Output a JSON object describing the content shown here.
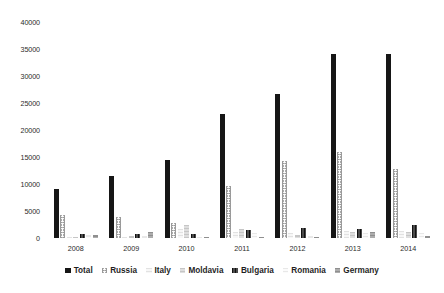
{
  "chart_data": {
    "type": "bar",
    "title": "",
    "subtitle": "",
    "xlabel": "",
    "ylabel": "",
    "categories": [
      "2008",
      "2009",
      "2010",
      "2011",
      "2012",
      "2013",
      "2014"
    ],
    "ylim": [
      0,
      40000
    ],
    "ytick_labels": [
      "40000",
      "35000",
      "30000",
      "25000",
      "20000",
      "15000",
      "10000",
      "5000",
      "0"
    ],
    "ytick_values": [
      40000,
      35000,
      30000,
      25000,
      20000,
      15000,
      10000,
      5000,
      0
    ],
    "grid": false,
    "legend_position": "bottom",
    "series": [
      {
        "name": "Total",
        "color": "#161616",
        "pattern": "solid",
        "values": [
          9000,
          11500,
          14500,
          23000,
          26700,
          34000,
          34000
        ]
      },
      {
        "name": "Russia",
        "color": "#9a9a9a",
        "pattern": "dotted-circles",
        "values": [
          4200,
          3900,
          2800,
          9700,
          14300,
          16000,
          12800
        ]
      },
      {
        "name": "Italy",
        "color": "#eeeeee",
        "pattern": "light-horizontal",
        "values": [
          200,
          200,
          1700,
          1200,
          900,
          1300,
          1300
        ]
      },
      {
        "name": "Moldavia",
        "color": "#d2d2d2",
        "pattern": "light-gray-horizontal",
        "values": [
          200,
          300,
          2500,
          1600,
          600,
          1200,
          1100
        ]
      },
      {
        "name": "Bulgaria",
        "color": "#2e2e2e",
        "pattern": "checked-dark",
        "values": [
          700,
          700,
          700,
          1400,
          1800,
          1700,
          2400
        ]
      },
      {
        "name": "Romania",
        "color": "#f2f2f2",
        "pattern": "very-light-horizontal",
        "values": [
          600,
          400,
          150,
          900,
          300,
          900,
          900
        ]
      },
      {
        "name": "Germany",
        "color": "#9e9e9e",
        "pattern": "medium-gray-horizontal",
        "values": [
          600,
          1200,
          200,
          250,
          150,
          1100,
          400
        ]
      }
    ]
  },
  "legend": {
    "items": [
      {
        "label": "Total"
      },
      {
        "label": "Russia"
      },
      {
        "label": "Italy"
      },
      {
        "label": "Moldavia"
      },
      {
        "label": "Bulgaria"
      },
      {
        "label": "Romania"
      },
      {
        "label": "Germany"
      }
    ]
  }
}
